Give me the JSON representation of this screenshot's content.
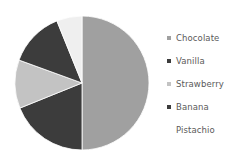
{
  "chart_data": {
    "type": "pie",
    "title": "",
    "categories": [
      "Chocolate",
      "Vanilla",
      "Strawberry",
      "Banana",
      "Pistachio"
    ],
    "values": [
      50,
      13,
      12,
      19,
      6
    ],
    "units": "percent",
    "start_angle_deg": 0,
    "direction": "clockwise",
    "legend_position": "right",
    "grid": false,
    "slices": [
      {
        "label": "Chocolate",
        "value": 50,
        "color": "#a0a0a0",
        "start_deg": 0,
        "end_deg": 180
      },
      {
        "label": "Banana",
        "value": 19,
        "color": "#3c3c3c",
        "start_deg": 180,
        "end_deg": 248
      },
      {
        "label": "Strawberry",
        "value": 12,
        "color": "#c3c3c3",
        "start_deg": 248,
        "end_deg": 290
      },
      {
        "label": "Vanilla",
        "value": 13,
        "color": "#3c3c3c",
        "start_deg": 290,
        "end_deg": 338
      },
      {
        "label": "Pistachio",
        "value": 6,
        "color": "#efefef",
        "start_deg": 338,
        "end_deg": 360
      }
    ],
    "geometry": {
      "cx": 82,
      "cy": 83,
      "r": 67
    }
  },
  "legend": {
    "items": [
      {
        "label": "Chocolate",
        "marker_color": "#a0a0a0",
        "marker_visible": true
      },
      {
        "label": "Vanilla",
        "marker_color": "#3c3c3c",
        "marker_visible": true
      },
      {
        "label": "Strawberry",
        "marker_color": "#c3c3c3",
        "marker_visible": true
      },
      {
        "label": "Banana",
        "marker_color": "#3c3c3c",
        "marker_visible": true
      },
      {
        "label": "Pistachio",
        "marker_color": "#efefef",
        "marker_visible": false
      }
    ]
  },
  "colors": {
    "background": "#ffffff",
    "text": "#5a5a5a",
    "chocolate": "#a0a0a0",
    "vanilla": "#3c3c3c",
    "strawberry": "#c3c3c3",
    "banana": "#3c3c3c",
    "pistachio": "#efefef"
  }
}
